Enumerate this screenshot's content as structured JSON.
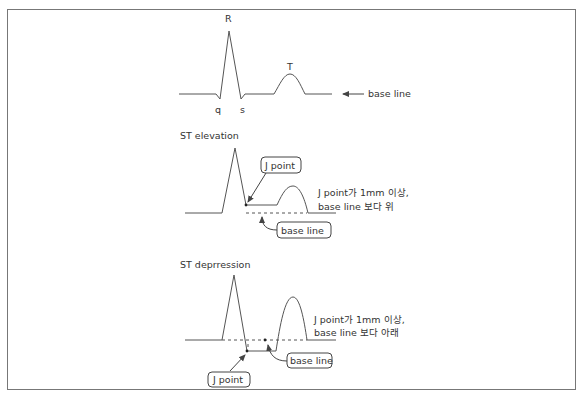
{
  "normal_ecg": {
    "r_label": "R",
    "t_label": "T",
    "q_label": "q",
    "s_label": "s",
    "baseline_label": "base line",
    "baseline_icon": "left-arrow-icon"
  },
  "st_elevation": {
    "title": "ST elevation",
    "j_point_label": "J point",
    "baseline_label": "base line",
    "description_line1": "J point가 1mm 이상,",
    "description_line2": "base line 보다 위"
  },
  "st_depression": {
    "title": "ST deprression",
    "j_point_label": "J point",
    "baseline_label": "base line",
    "description_line1": "J point가 1mm 이상,",
    "description_line2": "base line 보다 아래"
  }
}
